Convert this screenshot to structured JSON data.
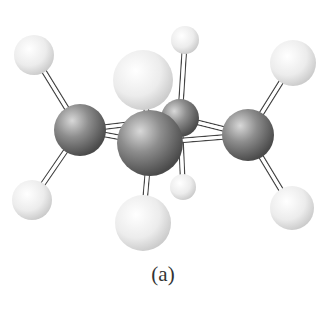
{
  "figure": {
    "caption": "(a)",
    "type": "ball-and-stick molecular model",
    "colors": {
      "carbon": "#7a7a7a",
      "hydrogen": "#ececec",
      "bond": "#ffffff",
      "bond_outline": "#444444"
    }
  },
  "atoms": [
    {
      "id": "H1",
      "element": "H",
      "x": 34,
      "y": 55,
      "r": 20
    },
    {
      "id": "H2",
      "element": "H",
      "x": 185,
      "y": 40,
      "r": 14
    },
    {
      "id": "H3",
      "element": "H",
      "x": 293,
      "y": 63,
      "r": 23
    },
    {
      "id": "H4",
      "element": "H",
      "x": 143,
      "y": 80,
      "r": 30
    },
    {
      "id": "C1",
      "element": "C",
      "x": 180,
      "y": 118,
      "r": 19
    },
    {
      "id": "C2",
      "element": "C",
      "x": 80,
      "y": 130,
      "r": 26
    },
    {
      "id": "C3",
      "element": "C",
      "x": 248,
      "y": 135,
      "r": 26
    },
    {
      "id": "H5",
      "element": "H",
      "x": 183,
      "y": 187,
      "r": 13
    },
    {
      "id": "C4",
      "element": "C",
      "x": 150,
      "y": 143,
      "r": 33
    },
    {
      "id": "H6",
      "element": "H",
      "x": 32,
      "y": 200,
      "r": 20
    },
    {
      "id": "H7",
      "element": "H",
      "x": 292,
      "y": 208,
      "r": 22
    },
    {
      "id": "H8",
      "element": "H",
      "x": 143,
      "y": 223,
      "r": 28
    }
  ],
  "bonds": [
    [
      "C2",
      "H1"
    ],
    [
      "C2",
      "H6"
    ],
    [
      "C3",
      "H3"
    ],
    [
      "C3",
      "H7"
    ],
    [
      "C1",
      "H2"
    ],
    [
      "C1",
      "H5"
    ],
    [
      "C4",
      "H4"
    ],
    [
      "C4",
      "H8"
    ],
    [
      "C2",
      "C4"
    ],
    [
      "C4",
      "C3"
    ],
    [
      "C3",
      "C1"
    ],
    [
      "C1",
      "C2"
    ]
  ]
}
